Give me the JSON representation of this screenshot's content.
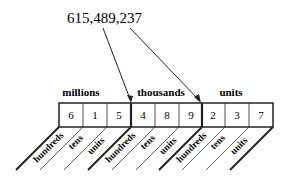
{
  "diagram": {
    "number": "615,489,237",
    "groups": [
      {
        "label": "millions",
        "digits": [
          "6",
          "1",
          "5"
        ]
      },
      {
        "label": "thousands",
        "digits": [
          "4",
          "8",
          "9"
        ]
      },
      {
        "label": "units",
        "digits": [
          "2",
          "3",
          "7"
        ]
      }
    ],
    "places": [
      "hundreds",
      "tens",
      "units"
    ],
    "colors": {
      "ink": "#222222",
      "background": "#ffffff"
    }
  }
}
